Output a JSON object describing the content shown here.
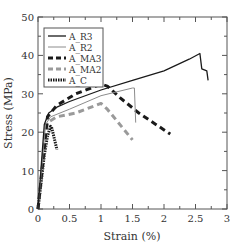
{
  "chart_data": {
    "type": "line",
    "title": "",
    "xlabel": "Strain (%)",
    "ylabel": "Stress (MPa)",
    "xlim": [
      0,
      3
    ],
    "ylim": [
      0,
      50
    ],
    "xticks": [
      "0",
      "0.5",
      "1",
      "1.5",
      "2",
      "2.5",
      "3"
    ],
    "yticks": [
      "0",
      "10",
      "20",
      "30",
      "40",
      "50"
    ],
    "grid": false,
    "legend_position": "upper left",
    "series": [
      {
        "name": "A_R3",
        "style": "solid",
        "color": "#1a1a1a",
        "x": [
          0,
          0.1,
          0.17,
          0.3,
          0.5,
          1.0,
          1.5,
          2.0,
          2.4,
          2.57,
          2.6,
          2.68,
          2.7
        ],
        "y": [
          0,
          22,
          25,
          26.5,
          28,
          31,
          33.5,
          36,
          39,
          40.5,
          36.5,
          36,
          33.5
        ]
      },
      {
        "name": "A_R2",
        "style": "solid",
        "color": "#8c8c8c",
        "x": [
          0,
          0.12,
          0.2,
          0.5,
          1.0,
          1.5,
          1.53,
          1.55
        ],
        "y": [
          0,
          22,
          24,
          26,
          29.5,
          31.5,
          31.5,
          22.5
        ]
      },
      {
        "name": "A_MA3",
        "style": "dashed",
        "color": "#1a1a1a",
        "x": [
          0,
          0.15,
          0.3,
          0.6,
          1.0,
          1.1,
          1.3,
          1.6,
          2.1
        ],
        "y": [
          0,
          24,
          27,
          30,
          32.5,
          32,
          29,
          25,
          19.5
        ]
      },
      {
        "name": "A_MA2",
        "style": "dashed",
        "color": "#9a9a9a",
        "x": [
          0,
          0.15,
          0.3,
          0.6,
          1.0,
          1.1,
          1.5
        ],
        "y": [
          0,
          22.5,
          24,
          25,
          27.5,
          26,
          18
        ]
      },
      {
        "name": "A_C",
        "style": "dotted",
        "color": "#1a1a1a",
        "x": [
          0,
          0.1,
          0.15,
          0.2,
          0.22,
          0.3
        ],
        "y": [
          0,
          14,
          19,
          21.5,
          21,
          15.5
        ]
      }
    ]
  }
}
